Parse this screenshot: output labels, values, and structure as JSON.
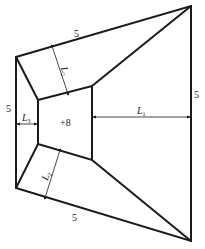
{
  "diagram": {
    "type": "trapezoidal-plan-with-inner-quadrilateral",
    "outer_labels": {
      "top_edge": "5",
      "bottom_edge": "5",
      "left_edge": "5",
      "right_edge": "5"
    },
    "inner_label": "+8",
    "dimensions": {
      "L1": {
        "symbol": "L",
        "subscript": "1"
      },
      "L2_top": {
        "symbol": "L",
        "subscript": "2"
      },
      "L2_bottom": {
        "symbol": "L",
        "subscript": "2"
      },
      "L3": {
        "symbol": "L",
        "subscript": "3"
      }
    },
    "colors": {
      "line": "#1a1a1a",
      "background": "#ffffff"
    }
  }
}
